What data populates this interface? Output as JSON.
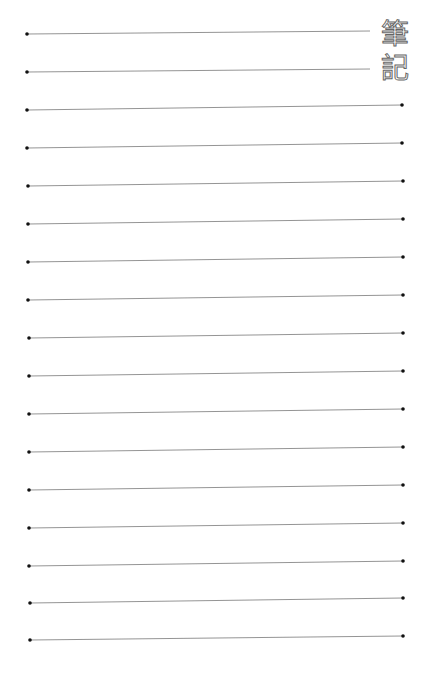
{
  "page": {
    "title_chars": [
      "筆",
      "記"
    ],
    "line_color": "#888888",
    "dot_color": "#111111",
    "lines": [
      {
        "x1": 27,
        "y1": 34,
        "x2": 370,
        "y2": 31,
        "right_dot": false
      },
      {
        "x1": 27,
        "y1": 72,
        "x2": 370,
        "y2": 69,
        "right_dot": false
      },
      {
        "x1": 27,
        "y1": 110,
        "x2": 402,
        "y2": 105,
        "right_dot": true
      },
      {
        "x1": 27,
        "y1": 148,
        "x2": 402,
        "y2": 143,
        "right_dot": true
      },
      {
        "x1": 28,
        "y1": 186,
        "x2": 403,
        "y2": 181,
        "right_dot": true
      },
      {
        "x1": 28,
        "y1": 224,
        "x2": 403,
        "y2": 219,
        "right_dot": true
      },
      {
        "x1": 28,
        "y1": 262,
        "x2": 403,
        "y2": 257,
        "right_dot": true
      },
      {
        "x1": 28,
        "y1": 300,
        "x2": 403,
        "y2": 295,
        "right_dot": true
      },
      {
        "x1": 29,
        "y1": 338,
        "x2": 403,
        "y2": 333,
        "right_dot": true
      },
      {
        "x1": 29,
        "y1": 376,
        "x2": 403,
        "y2": 371,
        "right_dot": true
      },
      {
        "x1": 29,
        "y1": 414,
        "x2": 403,
        "y2": 409,
        "right_dot": true
      },
      {
        "x1": 29,
        "y1": 452,
        "x2": 403,
        "y2": 447,
        "right_dot": true
      },
      {
        "x1": 29,
        "y1": 490,
        "x2": 403,
        "y2": 485,
        "right_dot": true
      },
      {
        "x1": 29,
        "y1": 528,
        "x2": 403,
        "y2": 523,
        "right_dot": true
      },
      {
        "x1": 29,
        "y1": 566,
        "x2": 403,
        "y2": 561,
        "right_dot": true
      },
      {
        "x1": 30,
        "y1": 603,
        "x2": 403,
        "y2": 598,
        "right_dot": true
      },
      {
        "x1": 30,
        "y1": 640,
        "x2": 403,
        "y2": 636,
        "right_dot": true
      }
    ]
  }
}
